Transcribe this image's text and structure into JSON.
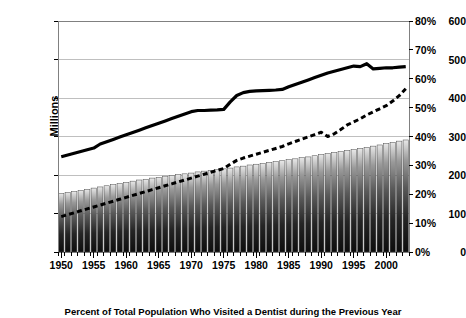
{
  "chart_data": {
    "type": "bar",
    "title": "",
    "caption": "Percent of Total Population Who Visited a Dentist during the Previous Year",
    "ylabel": "Millions",
    "xlabel": "",
    "ylim": [
      0,
      600
    ],
    "y2lim": [
      0,
      80
    ],
    "y2_suffix": "%",
    "grid": true,
    "legend": "none",
    "yticks": [
      "0",
      "100",
      "200",
      "300",
      "400",
      "500",
      "600"
    ],
    "ytick_values": [
      0,
      100,
      200,
      300,
      400,
      500,
      600
    ],
    "y2ticks": [
      "0%",
      "10%",
      "20%",
      "30%",
      "40%",
      "50%",
      "60%",
      "70%",
      "80%"
    ],
    "y2tick_values": [
      0,
      10,
      20,
      30,
      40,
      50,
      60,
      70,
      80
    ],
    "xticks": [
      "1950",
      "1955",
      "1960",
      "1965",
      "1970",
      "1975",
      "1980",
      "1985",
      "1990",
      "1995",
      "2000"
    ],
    "xtick_values": [
      1950,
      1955,
      1960,
      1965,
      1970,
      1975,
      1980,
      1985,
      1990,
      1995,
      2000
    ],
    "x": [
      1950,
      1951,
      1952,
      1953,
      1954,
      1955,
      1956,
      1957,
      1958,
      1959,
      1960,
      1961,
      1962,
      1963,
      1964,
      1965,
      1966,
      1967,
      1968,
      1969,
      1970,
      1971,
      1972,
      1973,
      1974,
      1975,
      1976,
      1977,
      1978,
      1979,
      1980,
      1981,
      1982,
      1983,
      1984,
      1985,
      1986,
      1987,
      1988,
      1989,
      1990,
      1991,
      1992,
      1993,
      1994,
      1995,
      1996,
      1997,
      1998,
      1999,
      2000,
      2001,
      2002,
      2003
    ],
    "series": [
      {
        "name": "Total Population",
        "type": "bar",
        "axis": "left",
        "units": "Millions",
        "values": [
          152,
          155,
          157,
          160,
          163,
          166,
          169,
          172,
          175,
          178,
          181,
          184,
          187,
          189,
          192,
          194,
          197,
          199,
          201,
          203,
          205,
          208,
          210,
          212,
          214,
          216,
          218,
          221,
          223,
          226,
          228,
          230,
          233,
          235,
          237,
          240,
          242,
          245,
          247,
          250,
          253,
          256,
          259,
          261,
          264,
          266,
          269,
          272,
          275,
          278,
          282,
          285,
          288,
          291
        ]
      },
      {
        "name": "Percent Who Visited a Dentist",
        "type": "line",
        "style": "solid",
        "axis": "right",
        "units": "%",
        "values": [
          33.0,
          33.6,
          34.2,
          34.8,
          35.4,
          36.0,
          37.4,
          38.2,
          39.0,
          39.8,
          40.6,
          41.4,
          42.2,
          43.0,
          43.8,
          44.6,
          45.4,
          46.2,
          47.0,
          47.8,
          48.6,
          49.0,
          49.0,
          49.1,
          49.2,
          49.4,
          52.0,
          54.2,
          55.2,
          55.6,
          55.8,
          55.9,
          56.0,
          56.1,
          56.3,
          57.2,
          58.0,
          58.8,
          59.6,
          60.4,
          61.2,
          62.0,
          62.6,
          63.2,
          63.8,
          64.4,
          64.2,
          65.2,
          63.4,
          63.6,
          63.8,
          63.8,
          64.0,
          64.2
        ]
      },
      {
        "name": "Number Who Visited a Dentist",
        "type": "line",
        "style": "dashed",
        "axis": "left",
        "units": "Millions",
        "values": [
          92,
          97,
          102,
          107,
          112,
          117,
          122,
          127,
          132,
          137,
          142,
          147,
          152,
          157,
          162,
          167,
          172,
          177,
          182,
          187,
          192,
          197,
          202,
          207,
          212,
          217,
          228,
          238,
          244,
          249,
          254,
          259,
          264,
          269,
          274,
          281,
          287,
          293,
          299,
          305,
          311,
          300,
          307,
          318,
          330,
          338,
          346,
          356,
          364,
          372,
          380,
          392,
          406,
          424
        ]
      }
    ]
  },
  "plot": {
    "left": 58,
    "right": 409,
    "top": 21,
    "bottom": 252,
    "border_color": "#808080",
    "grid_color": "#bfbfbf",
    "bar_top_color": "#e8e8e8",
    "bar_bottom_color": "#101010",
    "line_color": "#000000",
    "background": "#ffffff"
  }
}
